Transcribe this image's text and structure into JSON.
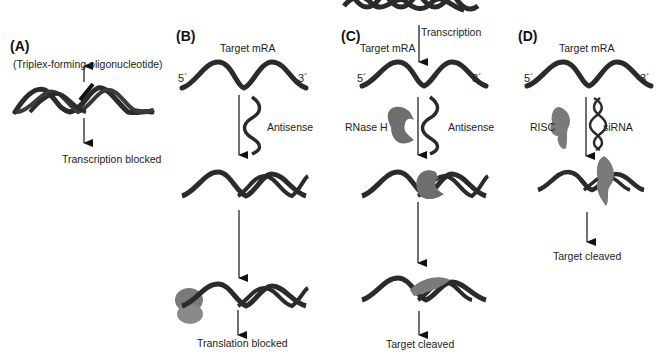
{
  "diagram": {
    "colors": {
      "strand": "#2b2b2b",
      "protein": "#7a7a7a",
      "arrow": "#111111",
      "background": "#ffffff"
    },
    "panels": {
      "A": {
        "label": "(A)",
        "agent": "(Triplex-forming oligonucleotide)",
        "outcome": "Transcription blocked"
      },
      "B": {
        "label": "(B)",
        "target": "Target mRA",
        "five_prime": "5´",
        "three_prime": "3´",
        "agent": "Antisense",
        "outcome": "Translation blocked"
      },
      "C": {
        "label": "(C)",
        "process": "Transcription",
        "target": "Target mRA",
        "five_prime": "5´",
        "three_prime": "3´",
        "enzyme": "RNase H",
        "agent": "Antisense",
        "outcome": "Target cleaved"
      },
      "D": {
        "label": "(D)",
        "target": "Target mRA",
        "five_prime": "5´",
        "three_prime": "3´",
        "enzyme": "RISC",
        "agent": "siRNA",
        "outcome": "Target cleaved"
      }
    }
  }
}
